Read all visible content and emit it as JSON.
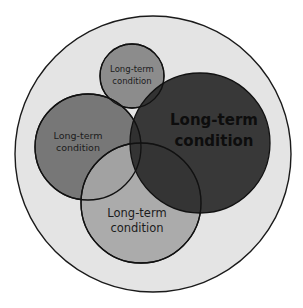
{
  "diagram": {
    "type": "overlapping-circles",
    "outer": {
      "fill": "#e4e4e4",
      "stroke": "#1a1a1a"
    },
    "circles": [
      {
        "id": "top-small",
        "line1": "Long-term",
        "line2": "condition",
        "fill": "#8c8c8c",
        "text_color": "#1c1c1c"
      },
      {
        "id": "left",
        "line1": "Long-term",
        "line2": "condition",
        "fill": "#777777",
        "text_color": "#1c1c1c"
      },
      {
        "id": "bottom",
        "line1": "Long-term",
        "line2": "condition",
        "fill": "#a6a6a6",
        "text_color": "#1c1c1c"
      },
      {
        "id": "right-large",
        "line1": "Long-term",
        "line2": "condition",
        "fill": "#2b2b2b",
        "text_color": "#0d0d0d"
      }
    ]
  }
}
